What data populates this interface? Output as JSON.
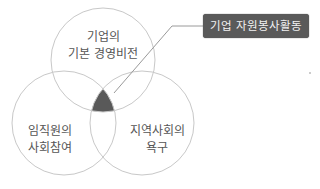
{
  "diagram": {
    "type": "venn",
    "circles": [
      {
        "id": "top",
        "label_lines": [
          "기업의",
          "기본 경영비전"
        ]
      },
      {
        "id": "left",
        "label_lines": [
          "임직원의",
          "사회참여"
        ]
      },
      {
        "id": "right",
        "label_lines": [
          "지역사회의",
          "욕구"
        ]
      }
    ],
    "intersection": {
      "label": "기업 자원봉사활동",
      "fill": "#595959"
    },
    "colors": {
      "circle_stroke": "#c8c8c8",
      "callout_bg": "#5a5a5a",
      "callout_text": "#f2f2f2",
      "leader_line": "#9a9a9a"
    }
  }
}
